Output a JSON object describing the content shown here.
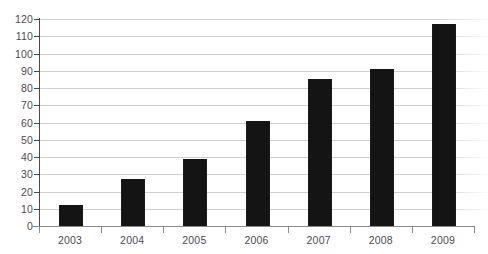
{
  "chart_data": {
    "type": "bar",
    "title": "",
    "xlabel": "",
    "ylabel": "",
    "categories": [
      "2003",
      "2004",
      "2005",
      "2006",
      "2007",
      "2008",
      "2009"
    ],
    "values": [
      12,
      27,
      39,
      61,
      85,
      91,
      117
    ],
    "ylim": [
      0,
      120
    ],
    "ytick_step": 10,
    "yticks": [
      "0",
      "10",
      "20",
      "30",
      "40",
      "50",
      "60",
      "70",
      "80",
      "90",
      "100",
      "110",
      "120"
    ],
    "grid": "horizontal",
    "legend": "none",
    "series": [
      {
        "name": "",
        "values": [
          12,
          27,
          39,
          61,
          85,
          91,
          117
        ],
        "color": "#141414"
      }
    ],
    "colors": {
      "bar": "#141414",
      "gridline": "#d2d2d2",
      "axis": "#4a4a4a",
      "text": "#4c4c52",
      "background": "#ffffff"
    }
  },
  "title_remnant": "",
  "axis": {
    "y_min_label": "0",
    "y_max_label": "120"
  }
}
